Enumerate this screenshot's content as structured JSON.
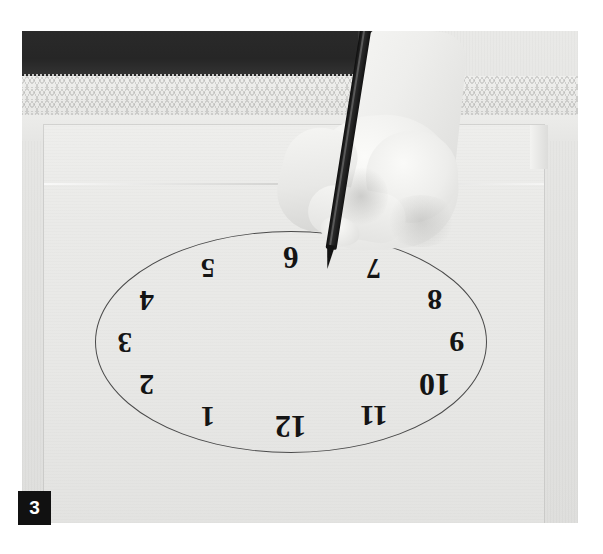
{
  "figure": {
    "number_label": "3",
    "caption": ""
  },
  "photo": {
    "subject": "hand-drawing-clock-face",
    "alt": "A hand holding a dark pencil writes the numeral 6 on a clock face drawn on a sheet of paper; the paper is oriented upside-down so the numbers read inverted and run counter-clockwise."
  },
  "clock": {
    "shape": "ellipse",
    "outline_color": "#4a4a4a",
    "numerals_rotation_deg": 180,
    "numerals": [
      {
        "label": "6",
        "angle_deg": 0,
        "size": 31
      },
      {
        "label": "7",
        "angle_deg": 30,
        "size": 29
      },
      {
        "label": "8",
        "angle_deg": 60,
        "size": 30
      },
      {
        "label": "9",
        "angle_deg": 90,
        "size": 30
      },
      {
        "label": "10",
        "angle_deg": 120,
        "size": 32
      },
      {
        "label": "11",
        "angle_deg": 150,
        "size": 30
      },
      {
        "label": "12",
        "angle_deg": 180,
        "size": 32
      },
      {
        "label": "1",
        "angle_deg": 210,
        "size": 29
      },
      {
        "label": "2",
        "angle_deg": 240,
        "size": 30
      },
      {
        "label": "3",
        "angle_deg": 270,
        "size": 29
      },
      {
        "label": "4",
        "angle_deg": 300,
        "size": 29
      },
      {
        "label": "5",
        "angle_deg": 330,
        "size": 28
      }
    ]
  },
  "colors": {
    "badge_background": "#111111",
    "badge_text": "#ffffff",
    "page_background": "#ffffff",
    "paper": "#eaeae8",
    "dark_band": "#2a2a2a",
    "pencil": "#131313"
  }
}
